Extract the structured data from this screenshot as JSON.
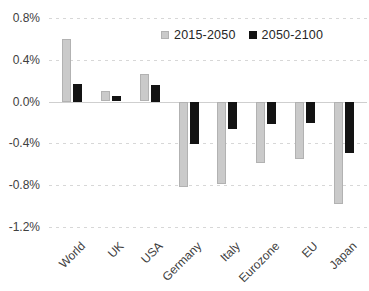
{
  "chart_data": {
    "type": "bar",
    "title": "",
    "categories": [
      "World",
      "UK",
      "USA",
      "Germany",
      "Italy",
      "Eurozone",
      "EU",
      "Japan"
    ],
    "series": [
      {
        "name": "2015-2050",
        "color": "#cacaca",
        "border_color": "#b2b2b2",
        "values": [
          0.6,
          0.1,
          0.26,
          -0.81,
          -0.78,
          -0.58,
          -0.55,
          -0.98
        ]
      },
      {
        "name": "2050-2100",
        "color": "#131313",
        "border_color": "#131313",
        "values": [
          0.17,
          0.05,
          0.16,
          -0.4,
          -0.26,
          -0.21,
          -0.2,
          -0.49
        ]
      }
    ],
    "xlabel": "",
    "ylabel": "",
    "ylim": [
      -1.2,
      0.8
    ],
    "yticks": [
      0.8,
      0.4,
      0.0,
      -0.4,
      -0.8,
      -1.2
    ],
    "ytick_labels": [
      "0.8%",
      "0.4%",
      "0.0%",
      "-0.4%",
      "-0.8%",
      "-1.2%"
    ],
    "grid": "horizontal-dashed",
    "zero_line": "solid",
    "legend_position": "top-right",
    "axis_text_color": "#404040",
    "gridline_color": "#d7d7d7"
  }
}
